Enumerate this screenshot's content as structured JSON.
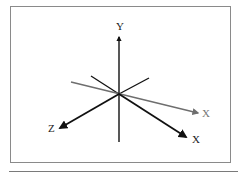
{
  "diagram": {
    "origin": [
      119,
      94
    ],
    "axes": [
      {
        "id": "y",
        "label": "Y",
        "color": "#111111",
        "from": [
          119,
          142
        ],
        "to": [
          119,
          37
        ],
        "label_pos": [
          116,
          30
        ]
      },
      {
        "id": "x-rotated",
        "label": "X",
        "color": "#6e6e6e",
        "from": [
          71,
          82
        ],
        "to": [
          198,
          113
        ],
        "label_pos": [
          202,
          117
        ]
      },
      {
        "id": "x",
        "label": "X",
        "color": "#111111",
        "from": [
          119,
          94
        ],
        "to": [
          186,
          137
        ],
        "label_pos": [
          192,
          143
        ]
      },
      {
        "id": "z",
        "label": "Z",
        "color": "#111111",
        "from": [
          119,
          94
        ],
        "to": [
          60,
          128
        ],
        "label_pos": [
          48,
          132
        ]
      }
    ],
    "back_segments": [
      {
        "from": [
          119,
          94
        ],
        "to": [
          91,
          76
        ],
        "color": "#111111"
      },
      {
        "from": [
          119,
          94
        ],
        "to": [
          149,
          78
        ],
        "color": "#111111"
      }
    ]
  }
}
